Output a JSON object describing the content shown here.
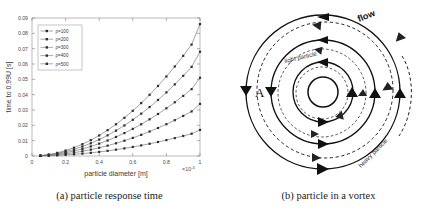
{
  "figure": {
    "panels": [
      {
        "key": "a",
        "caption": "(a) particle response time"
      },
      {
        "key": "b",
        "caption": "(b) particle in a vortex"
      }
    ]
  },
  "chart_data": {
    "type": "line",
    "title": "",
    "xlabel": "particle diameter [m]",
    "ylabel": "time to 0.99U [s]",
    "x_exponent_label": "×10",
    "x_exponent_sup": "-4",
    "xlim": [
      0,
      0.0001
    ],
    "ylim": [
      0,
      0.09
    ],
    "xticks": [
      0,
      0.2,
      0.4,
      0.6,
      0.8,
      1
    ],
    "xtick_labels": [
      "0",
      "0.2",
      "0.4",
      "0.6",
      "0.8",
      "1"
    ],
    "yticks": [
      0,
      0.01,
      0.02,
      0.03,
      0.04,
      0.05,
      0.06,
      0.07,
      0.08,
      0.09
    ],
    "ytick_labels": [
      "0",
      "0.01",
      "0.02",
      "0.03",
      "0.04",
      "0.05",
      "0.06",
      "0.07",
      "0.08",
      "0.09"
    ],
    "grid": false,
    "legend_position": "upper-left",
    "x": [
      0.05,
      0.1,
      0.15,
      0.2,
      0.25,
      0.3,
      0.35,
      0.4,
      0.45,
      0.5,
      0.55,
      0.6,
      0.65,
      0.7,
      0.75,
      0.8,
      0.85,
      0.9,
      0.95,
      1.0
    ],
    "series": [
      {
        "name": "ρ=100",
        "marker": "square",
        "values": [
          5e-05,
          0.00019,
          0.00041,
          0.00071,
          0.00108,
          0.00154,
          0.00207,
          0.00268,
          0.00337,
          0.00414,
          0.00498,
          0.0059,
          0.0069,
          0.00798,
          0.00913,
          0.01037,
          0.01168,
          0.01306,
          0.01453,
          0.017
        ]
      },
      {
        "name": "ρ=200",
        "marker": "square",
        "values": [
          0.0001,
          0.00038,
          0.00082,
          0.00142,
          0.00217,
          0.00309,
          0.00415,
          0.00537,
          0.00674,
          0.00828,
          0.00996,
          0.0118,
          0.0138,
          0.01596,
          0.01827,
          0.02074,
          0.02336,
          0.02613,
          0.02906,
          0.034
        ]
      },
      {
        "name": "ρ=300",
        "marker": "square",
        "values": [
          0.00015,
          0.00057,
          0.00123,
          0.00214,
          0.00325,
          0.00463,
          0.00622,
          0.00805,
          0.01011,
          0.01242,
          0.01494,
          0.0177,
          0.0207,
          0.02394,
          0.0274,
          0.03111,
          0.03504,
          0.0392,
          0.0436,
          0.051
        ]
      },
      {
        "name": "ρ=400",
        "marker": "square",
        "values": [
          0.0002,
          0.00076,
          0.00164,
          0.00285,
          0.00434,
          0.00617,
          0.00829,
          0.01073,
          0.01348,
          0.01656,
          0.01992,
          0.0236,
          0.0276,
          0.03192,
          0.03653,
          0.04148,
          0.04672,
          0.05226,
          0.05813,
          0.068
        ]
      },
      {
        "name": "ρ=500",
        "marker": "square",
        "values": [
          0.00025,
          0.00095,
          0.00205,
          0.00356,
          0.00542,
          0.00771,
          0.01036,
          0.01341,
          0.01685,
          0.0207,
          0.0249,
          0.0295,
          0.0345,
          0.0399,
          0.04566,
          0.05185,
          0.0584,
          0.06532,
          0.07266,
          0.086
        ]
      }
    ]
  },
  "vortex": {
    "labels": {
      "flow": "flow",
      "light_particle": "light particle",
      "heavy_particle": "heavy particle",
      "point_a": "A"
    }
  }
}
